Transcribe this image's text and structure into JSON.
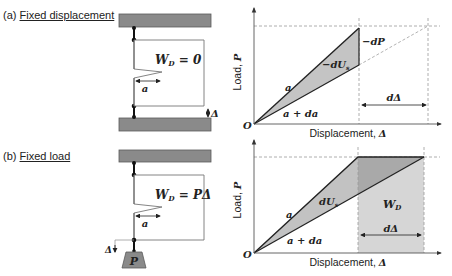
{
  "panel_a": {
    "label_prefix": "(a) ",
    "label_title": "Fixed displacement",
    "work_label": "W_D = 0",
    "work_label_main": "W",
    "work_label_sub": "D",
    "work_label_rest": " = 0",
    "crack_length": "a",
    "displacement_symbol": "Δ"
  },
  "panel_b": {
    "label_prefix": "(b) ",
    "label_title": "Fixed load",
    "work_label_main": "W",
    "work_label_sub": "D",
    "work_label_rest": " = PΔ",
    "crack_length": "a",
    "displacement_symbol": "Δ",
    "weight_label": "P"
  },
  "chart_a": {
    "ylabel": "Load, P",
    "ylabel_text": "Load, ",
    "ylabel_sym": "P",
    "xlabel_text": "Displacement, ",
    "xlabel_sym": "Δ",
    "origin": "O",
    "line_a": "a",
    "line_ada": "a + da",
    "strain_energy": "−dU",
    "strain_energy_sub": "s",
    "load_drop": "−dP",
    "increment": "dΔ"
  },
  "chart_b": {
    "ylabel_text": "Load, ",
    "ylabel_sym": "P",
    "xlabel_text": "Displacement, ",
    "xlabel_sym": "Δ",
    "origin": "O",
    "line_a": "a",
    "line_ada": "a + da",
    "strain_energy": "dU",
    "strain_energy_sub": "s",
    "work_main": "W",
    "work_sub": "D",
    "increment": "dΔ"
  },
  "colors": {
    "plate": "#8a8a8a",
    "plate_border": "#5a5a5a",
    "shade_light": "#d4d4d4",
    "shade_mid": "#b8b8b8",
    "shade_dark": "#a6a6a6",
    "line": "#222222",
    "dashed": "#999999"
  }
}
